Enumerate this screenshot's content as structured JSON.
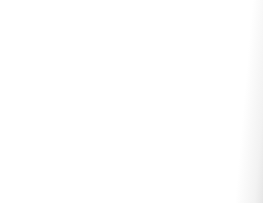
{
  "figure": {
    "caption": "FIG. 2.1",
    "background_color": "#fdfdfd",
    "ink_color": "#141414",
    "panel_labels": [
      "A",
      "B",
      "C",
      "D"
    ]
  },
  "panels": [
    {
      "id": "A",
      "label": "A",
      "shape": "circle",
      "label_side": "left",
      "description": "round oocyte with central ring nucleus and scattered yolk granules",
      "nucleus": {
        "present": true,
        "style": "ring-with-nucleolus",
        "position": "center"
      },
      "polar_body": false,
      "granule_count": 86
    },
    {
      "id": "B",
      "label": "B",
      "shape": "circle",
      "label_side": "right",
      "description": "round oocyte, nucleus displaced toward the animal pole, granules massed in the vegetal half",
      "nucleus": {
        "present": true,
        "style": "ring-with-nucleolus",
        "position": "upper-center"
      },
      "polar_body": false,
      "granule_count": 96
    },
    {
      "id": "C",
      "label": "C",
      "shape": "circle",
      "label_side": "left",
      "description": "round egg with a solid dark polar body at the animal pole and a crescent furrow beneath it",
      "nucleus": {
        "present": false,
        "style": "none",
        "position": "none"
      },
      "polar_body": true,
      "granule_count": 112
    },
    {
      "id": "D",
      "label": "D",
      "shape": "elongated-bean",
      "label_side": "right",
      "description": "elongated kidney-shaped egg with double contour membrane and dense granules",
      "nucleus": {
        "present": false,
        "style": "none",
        "position": "none"
      },
      "polar_body": false,
      "granule_count": 130
    }
  ]
}
